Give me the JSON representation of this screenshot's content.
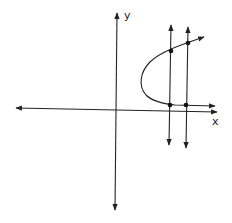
{
  "diagram": {
    "axes": {
      "x_label": "x",
      "y_label": "y"
    },
    "curve": {
      "type": "sideways-parabola",
      "opens": "right"
    },
    "vertical_lines": [
      {
        "name": "vertical-line-1",
        "intersections": 2
      },
      {
        "name": "vertical-line-2",
        "intersections": 2
      }
    ],
    "intersection_points_count": 4,
    "colors": {
      "stroke": "#222222",
      "background": "#ffffff"
    }
  }
}
